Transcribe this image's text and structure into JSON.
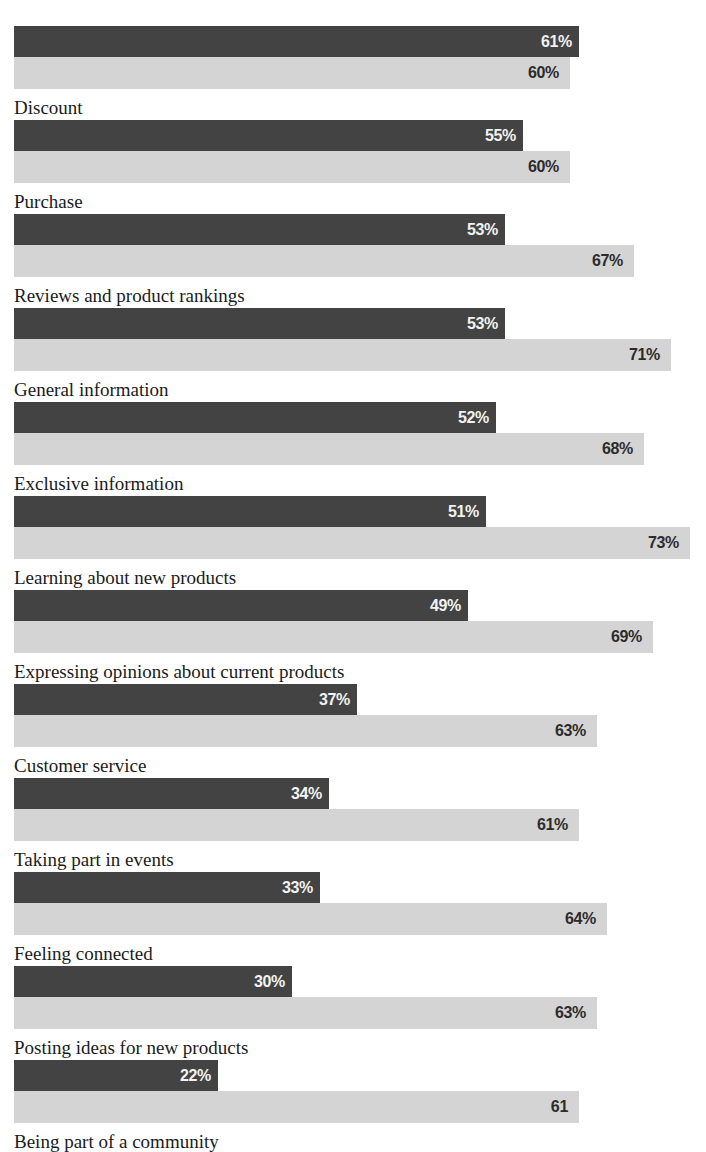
{
  "chart_data": {
    "type": "bar",
    "orientation": "horizontal",
    "title": "",
    "xlabel": "",
    "ylabel": "",
    "xlim": [
      0,
      75
    ],
    "grid": false,
    "legend": "none",
    "value_suffix": "%",
    "colors": {
      "series_1": "#434343",
      "series_2": "#d4d4d4",
      "label_text": "#1b1b1b",
      "dark_value_text": "#f2f2f2",
      "light_value_text": "#2c2c2c",
      "background": "#ffffff"
    },
    "categories": [
      "Discount",
      "Purchase",
      "Reviews and product rankings",
      "General information",
      "Exclusive information",
      "Learning about new products",
      "Expressing opinions about current products",
      "Customer service",
      "Taking part in events",
      "Feeling connected",
      "Posting ideas for new products",
      "Being part of a community"
    ],
    "series": [
      {
        "name": "series-dark",
        "values": [
          61,
          55,
          53,
          53,
          52,
          51,
          49,
          37,
          34,
          33,
          30,
          22
        ],
        "labels": [
          "61%",
          "55%",
          "53%",
          "53%",
          "52%",
          "51%",
          "49%",
          "37%",
          "34%",
          "33%",
          "30%",
          "22%"
        ]
      },
      {
        "name": "series-light",
        "values": [
          60,
          60,
          67,
          71,
          68,
          73,
          69,
          63,
          61,
          64,
          63,
          61
        ],
        "labels": [
          "60%",
          "60%",
          "67%",
          "71%",
          "68%",
          "73%",
          "69%",
          "63%",
          "61%",
          "64%",
          "63%",
          "61"
        ]
      }
    ]
  },
  "top_clipped_text": ""
}
